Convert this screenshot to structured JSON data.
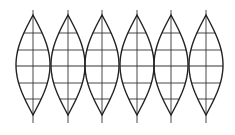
{
  "diagram": {
    "title": "",
    "type": "globe-gores",
    "gore_count": 6,
    "gore_centers_x": [
      33,
      68,
      102,
      137,
      171,
      206
    ],
    "gore_half_width": 17,
    "top_tip_y": 15,
    "bottom_tip_y": 115,
    "meridian_top_y": 10,
    "meridian_bottom_y": 123,
    "parallels_y": [
      33,
      50,
      66,
      83,
      99
    ],
    "colors": {
      "outline": "#222222",
      "grid": "#333333",
      "background": "#ffffff"
    }
  }
}
